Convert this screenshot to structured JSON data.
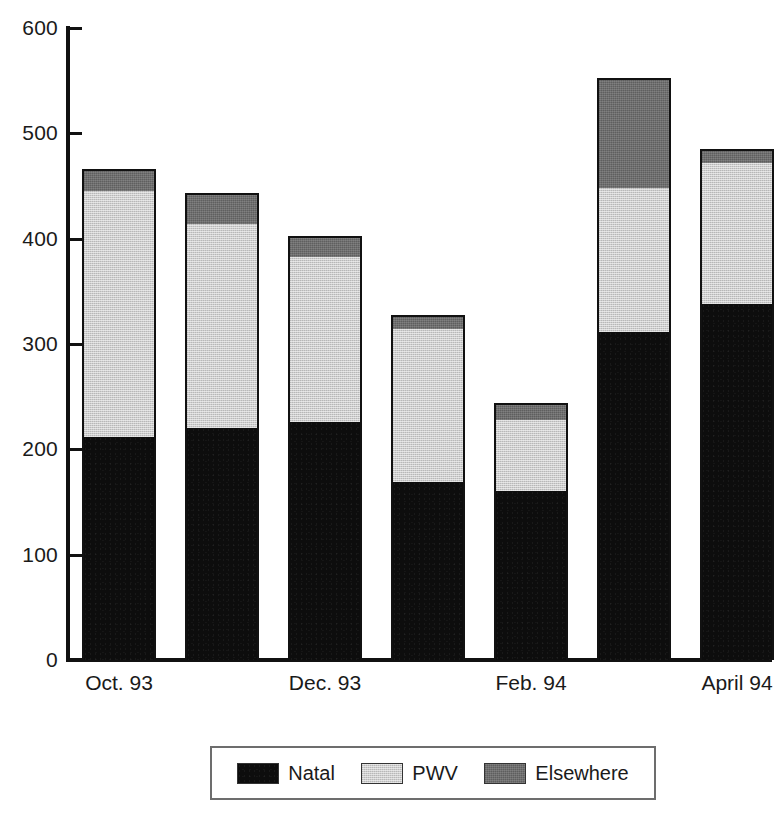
{
  "chart_data": {
    "type": "bar",
    "subtype": "stacked-vertical",
    "title": "",
    "xlabel": "",
    "ylabel": "",
    "ylim": [
      0,
      600
    ],
    "yticks": [
      0,
      100,
      200,
      300,
      400,
      500,
      600
    ],
    "ytick_labels": [
      "0",
      "100",
      "200",
      "300",
      "400",
      "500",
      "600"
    ],
    "grid": false,
    "legend_position": "bottom",
    "categories": [
      "Oct. 93",
      "Nov. 93",
      "Dec. 93",
      "Jan. 94",
      "Feb. 94",
      "March 94",
      "April 94"
    ],
    "tick_labels": [
      "Oct. 93",
      "",
      "Dec. 93",
      "",
      "Feb. 94",
      "",
      "April 94"
    ],
    "series": [
      {
        "name": "Natal",
        "color": "#0d0d0d",
        "values": [
          212,
          220,
          226,
          169,
          160,
          311,
          338
        ]
      },
      {
        "name": "PWV",
        "color": "#cdcdcd",
        "values": [
          233,
          194,
          157,
          145,
          68,
          137,
          134
        ]
      },
      {
        "name": "Elsewhere",
        "color": "#6e6e6e",
        "values": [
          21,
          29,
          20,
          14,
          16,
          105,
          13
        ]
      }
    ],
    "totals": [
      466,
      443,
      403,
      328,
      244,
      553,
      485
    ]
  },
  "axis": {
    "y": {
      "ticks": [
        {
          "value": 600,
          "label": "600"
        },
        {
          "value": 500,
          "label": "500"
        },
        {
          "value": 400,
          "label": "400"
        },
        {
          "value": 300,
          "label": "300"
        },
        {
          "value": 200,
          "label": "200"
        },
        {
          "value": 100,
          "label": "100"
        },
        {
          "value": 0,
          "label": "0"
        }
      ]
    },
    "x": {
      "labels": [
        {
          "index": 0,
          "label": "Oct. 93"
        },
        {
          "index": 2,
          "label": "Dec. 93"
        },
        {
          "index": 4,
          "label": "Feb. 94"
        },
        {
          "index": 6,
          "label": "April 94"
        }
      ]
    }
  },
  "legend": {
    "items": [
      {
        "label": "Natal",
        "color": "#0d0d0d",
        "swatch": "natal-swatch"
      },
      {
        "label": "PWV",
        "color": "#cdcdcd",
        "swatch": "pwv-swatch"
      },
      {
        "label": "Elsewhere",
        "color": "#6e6e6e",
        "swatch": "elsewhere-swatch"
      }
    ]
  },
  "colors": {
    "axis": "#111111",
    "background": "#ffffff",
    "text": "#1a1a1a",
    "legend_border": "#6d6d6d"
  }
}
